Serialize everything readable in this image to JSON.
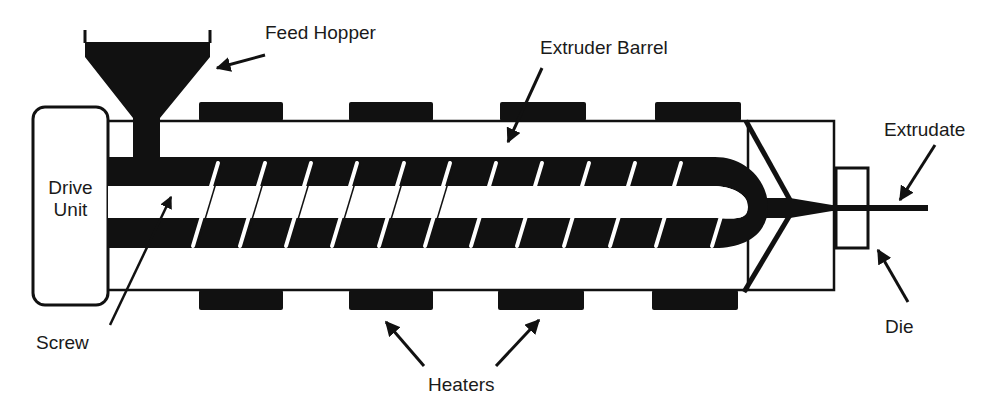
{
  "diagram": {
    "colors": {
      "ink": "#111111",
      "background": "#ffffff",
      "text": "#1a1a1a"
    },
    "labels": {
      "feed_hopper": "Feed Hopper",
      "extruder_barrel": "Extruder Barrel",
      "extrudate": "Extrudate",
      "drive_unit_line1": "Drive",
      "drive_unit_line2": "Unit",
      "screw": "Screw",
      "die": "Die",
      "heaters": "Heaters"
    },
    "components": [
      "Feed Hopper",
      "Extruder Barrel",
      "Drive Unit",
      "Screw",
      "Heaters",
      "Die",
      "Extrudate"
    ],
    "heater_count_top": 4,
    "heater_count_bottom": 4
  }
}
